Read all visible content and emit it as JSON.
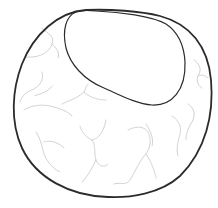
{
  "diagram": {
    "type": "cell-illustration",
    "colors": {
      "background": "#ffffff",
      "membrane": "#2b2b2b",
      "nucleus": "#2b2b2b",
      "filaments": "#c8c8c8"
    },
    "parts": [
      {
        "name": "cell-membrane",
        "label": ""
      },
      {
        "name": "nucleus",
        "label": ""
      },
      {
        "name": "cytoplasmic-filaments",
        "label": ""
      }
    ]
  }
}
